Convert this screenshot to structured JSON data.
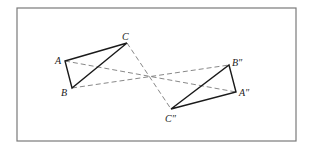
{
  "figure": {
    "frame": {
      "x": 17,
      "y": 8,
      "width": 279,
      "height": 133
    },
    "colors": {
      "frame": "#7a7a7a",
      "triangle": "#1a1a1a",
      "dashed": "#6a6a6a",
      "background": "#ffffff"
    },
    "center": {
      "x": 150,
      "y": 76
    },
    "triangle_original": {
      "A": {
        "label": "A",
        "x": 65,
        "y": 61
      },
      "B": {
        "label": "B",
        "x": 72,
        "y": 88
      },
      "C": {
        "label": "C",
        "x": 127,
        "y": 43
      }
    },
    "triangle_image": {
      "A2": {
        "label": "A″",
        "x": 236,
        "y": 92
      },
      "B2": {
        "label": "B″",
        "x": 229,
        "y": 65
      },
      "C2": {
        "label": "C″",
        "x": 171,
        "y": 109
      }
    },
    "dashed_connectors": [
      {
        "from": "A",
        "to": "A″"
      },
      {
        "from": "B",
        "to": "B″"
      },
      {
        "from": "C",
        "to": "C″"
      }
    ]
  }
}
